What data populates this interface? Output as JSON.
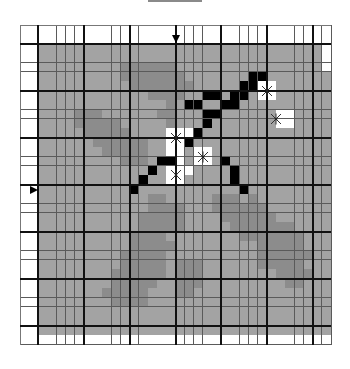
{
  "title_bar": {
    "visible": true
  },
  "grid": {
    "cols": 34,
    "rows": 34,
    "cell_w": 9.15,
    "cell_h": 9.4,
    "major_every": 5,
    "major_offset": 2,
    "legend": {
      "w": "outside-empty",
      "g": "area",
      "d": "shadow",
      "k": "filled",
      "W": "selected"
    },
    "colors": {
      "w": "#ffffff",
      "g": "#a3a3a3",
      "d": "#8c8c8c",
      "k": "#000000",
      "W": "#ffffff",
      "line": "#5a5a5a",
      "major": "#111111"
    },
    "map": [
      "wwwwwwwwwwwwwwwwwwwwwwwwwwwwwwwwww",
      "wwwwwwwwwwwwwwwwwwwwwwwwwwwwwwwwww",
      "wwgggggggggggggggggggggggggggggggwww",
      "wwgggggggggggggggggggggggggggggggwww",
      "wwgggggggggddddddggggggggggggggggwww",
      "wwgggggggggdddddddgggggggkkgggggggww",
      "wwggggggggggdddddddgggggkkWWggggggww",
      "wwggggggggggggddddggkkgkkgWWggggggww",
      "wwggggggggggggggdgkkggkkggggggggggww",
      "wwggggdddggggggddgggkkggggggWWggggww",
      "wwggggdddddgggggdgggkgggggggWWggggww",
      "wwgggggdddddggggWWWkgggggggggggggggww",
      "wwggggggddddddggWWkgggggggggggggggww",
      "wwgggggggdddddggWWgWWgggggggggggggww",
      "wwgggggggggdddgkkWgWWgkgggggggggggww",
      "wwggggggggggggkgWWWggggkgggggggggggww",
      "wwgggggggggggkggWWgggggkgggggggggggww",
      "wwggggggggggkgggggggggggkgggggggggww",
      "wwggggggggggggddgggggdddgdgggggggggww",
      "wwggggggggggggddddgggddddddgggggggww",
      "wwgggggggggggdddddggggddddddggggggww",
      "wwgggggggggggdddddgggggdddddddggggww",
      "wwggggggggggddddggggggggdddddddgggww",
      "wwggggggggggdddddgggggggggdddddgggww",
      "wwgggggggggdddddggggggggggddddddggww",
      "wwgggggggggdddddgdddggggggdddddgggww",
      "wwggggggggddddddgdddggggggggddddggww",
      "wwggggggggdddddggdddgggggggggddgggww",
      "wwgggggggdddddgggddggggggggggggggggww",
      "wwggggggggddddggggggggggggggggggggww",
      "wwggggggggggggggggggggggggggggggggww",
      "wwggggggggggggggggggggggggggggggggww",
      "wwggggggggggggggggggggggggggggggggww",
      "wwwwwwwwwwwwwwwwwwwwwwwwwwwwwwwwww"
    ],
    "markers": [
      {
        "icon": "x-marker",
        "col": 27,
        "row": 7
      },
      {
        "icon": "x-marker",
        "col": 28,
        "row": 10
      },
      {
        "icon": "x-marker",
        "col": 17,
        "row": 12
      },
      {
        "icon": "x-marker",
        "col": 20,
        "row": 14
      },
      {
        "icon": "x-marker",
        "col": 17,
        "row": 16
      }
    ],
    "pointers": [
      {
        "icon": "arrow-down-icon",
        "col": 17,
        "row": 0,
        "side": "top"
      },
      {
        "icon": "arrow-right-icon",
        "col": 0,
        "row": 17,
        "side": "left"
      }
    ]
  }
}
